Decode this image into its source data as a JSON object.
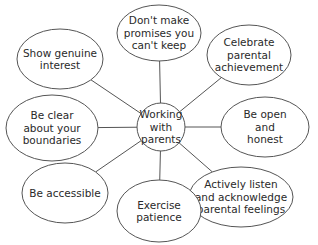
{
  "diagram": {
    "type": "mind-map",
    "center": {
      "label_lines": [
        "Working",
        "with",
        "parents"
      ],
      "cx": 161,
      "cy": 127,
      "r": 24
    },
    "nodes": [
      {
        "id": "dont-make-promises",
        "label_lines": [
          "Don't make",
          "promises you",
          "can't keep"
        ],
        "cx": 159,
        "cy": 33,
        "rx": 42,
        "ry": 28
      },
      {
        "id": "celebrate-achievement",
        "label_lines": [
          "Celebrate",
          "parental",
          "achievement"
        ],
        "cx": 249,
        "cy": 55,
        "rx": 42,
        "ry": 30
      },
      {
        "id": "open-honest",
        "label_lines": [
          "Be open",
          "and",
          "honest"
        ],
        "cx": 265,
        "cy": 127,
        "rx": 44,
        "ry": 30
      },
      {
        "id": "actively-listen",
        "label_lines": [
          "Actively listen",
          "and acknowledge",
          "parental feelings"
        ],
        "cx": 241,
        "cy": 197,
        "rx": 52,
        "ry": 30
      },
      {
        "id": "exercise-patience",
        "label_lines": [
          "Exercise",
          "patience"
        ],
        "cx": 159,
        "cy": 211,
        "rx": 42,
        "ry": 31
      },
      {
        "id": "be-accessible",
        "label_lines": [
          "Be accessible"
        ],
        "cx": 65,
        "cy": 193,
        "rx": 43,
        "ry": 30
      },
      {
        "id": "clear-boundaries",
        "label_lines": [
          "Be clear",
          "about your",
          "boundaries"
        ],
        "cx": 52,
        "cy": 128,
        "rx": 46,
        "ry": 33
      },
      {
        "id": "genuine-interest",
        "label_lines": [
          "Show genuine",
          "interest"
        ],
        "cx": 60,
        "cy": 59,
        "rx": 43,
        "ry": 30
      }
    ],
    "colors": {
      "stroke": "#555555",
      "text": "#2a2a2a",
      "background": "#ffffff"
    }
  }
}
